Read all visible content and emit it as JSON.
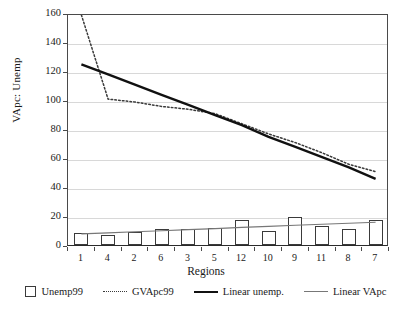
{
  "chart_data": {
    "type": "bar",
    "title": "",
    "xlabel": "Regions",
    "ylabel": "VApc: Unemp",
    "categories": [
      "1",
      "4",
      "2",
      "6",
      "3",
      "5",
      "12",
      "10",
      "9",
      "11",
      "8",
      "7"
    ],
    "ylim": [
      0,
      160
    ],
    "yticks": [
      0,
      20,
      40,
      60,
      80,
      100,
      120,
      140,
      160
    ],
    "grid": true,
    "legend_position": "bottom",
    "series": [
      {
        "name": "Unemp99",
        "type": "bar",
        "values": [
          8,
          7,
          9,
          11,
          11,
          12,
          17,
          10,
          19,
          13,
          11,
          17
        ]
      },
      {
        "name": "GVApc99",
        "type": "line",
        "style": "dotted",
        "values": [
          168,
          102,
          100,
          97,
          95,
          92,
          85,
          78,
          72,
          65,
          57,
          52
        ]
      },
      {
        "name": "Linear unemp.",
        "type": "trendline",
        "style": "solid-thick",
        "values": [
          126,
          119,
          112,
          105,
          98,
          91,
          84,
          76,
          69,
          62,
          55,
          47
        ]
      },
      {
        "name": "Linear VApc",
        "type": "trendline",
        "style": "solid-thin",
        "values": [
          9,
          9.7,
          10.5,
          11.2,
          12,
          12.7,
          13.5,
          14.2,
          15,
          15.7,
          16.4,
          17
        ]
      }
    ]
  },
  "axes": {
    "y_title": "VApc: Unemp",
    "x_title": "Regions",
    "y_tick_labels": [
      "160",
      "140",
      "120",
      "100",
      "80",
      "60",
      "40",
      "20",
      "0"
    ],
    "x_tick_labels": [
      "1",
      "4",
      "2",
      "6",
      "3",
      "5",
      "12",
      "10",
      "9",
      "11",
      "8",
      "7"
    ]
  },
  "legend": {
    "items": [
      {
        "label": "Unemp99",
        "marker": "open-square-marker"
      },
      {
        "label": "GVApc99",
        "marker": "dotted-line-marker"
      },
      {
        "label": "Linear unemp.",
        "marker": "thick-line-marker"
      },
      {
        "label": "Linear VApc",
        "marker": "thin-line-marker"
      }
    ]
  },
  "colors": {
    "bar_stroke": "#3a3a3a",
    "bar_fill": "#ffffff",
    "dotted_line": "#3a3a3a",
    "linear_unemp": "#111111",
    "linear_vapc": "#777777",
    "grid": "#d8d8d8",
    "axis": "#4a4a4a"
  }
}
